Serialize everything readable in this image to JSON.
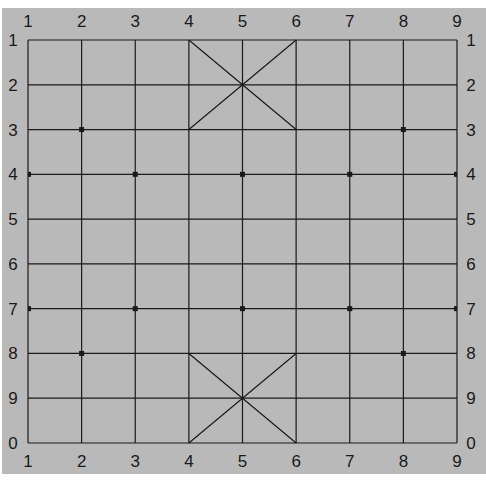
{
  "board": {
    "type": "xiangqi-board",
    "columns": 9,
    "rows": 10,
    "background_color": "#b9b9b9",
    "line_color": "#1a1a1a",
    "top_labels": [
      "1",
      "2",
      "3",
      "4",
      "5",
      "6",
      "7",
      "8",
      "9"
    ],
    "bottom_labels": [
      "1",
      "2",
      "3",
      "4",
      "5",
      "6",
      "7",
      "8",
      "9"
    ],
    "left_labels": [
      "1",
      "2",
      "3",
      "4",
      "5",
      "6",
      "7",
      "8",
      "9",
      "0"
    ],
    "right_labels": [
      "1",
      "2",
      "3",
      "4",
      "5",
      "6",
      "7",
      "8",
      "9",
      "0"
    ],
    "palaces": [
      {
        "name": "top-palace",
        "cols": [
          4,
          6
        ],
        "rows": [
          1,
          3
        ]
      },
      {
        "name": "bottom-palace",
        "cols": [
          4,
          6
        ],
        "rows": [
          8,
          10
        ]
      }
    ],
    "marks": [
      {
        "col": 2,
        "row": 3
      },
      {
        "col": 8,
        "row": 3
      },
      {
        "col": 1,
        "row": 4
      },
      {
        "col": 3,
        "row": 4
      },
      {
        "col": 5,
        "row": 4
      },
      {
        "col": 7,
        "row": 4
      },
      {
        "col": 9,
        "row": 4
      },
      {
        "col": 1,
        "row": 7
      },
      {
        "col": 3,
        "row": 7
      },
      {
        "col": 5,
        "row": 7
      },
      {
        "col": 7,
        "row": 7
      },
      {
        "col": 9,
        "row": 7
      },
      {
        "col": 2,
        "row": 8
      },
      {
        "col": 8,
        "row": 8
      }
    ]
  }
}
